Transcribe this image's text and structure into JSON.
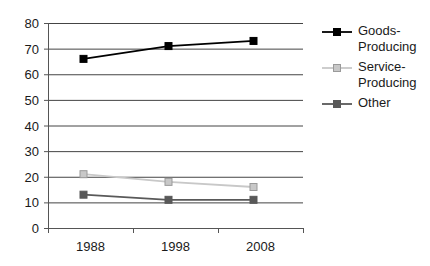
{
  "chart_data": {
    "type": "line",
    "title": "",
    "subtitle": "",
    "xlabel": "",
    "ylabel": "",
    "categories": [
      "1988",
      "1998",
      "2008"
    ],
    "ylim": [
      0,
      80
    ],
    "yticks": [
      0,
      10,
      20,
      30,
      40,
      50,
      60,
      70,
      80
    ],
    "ytick_labels": [
      "0",
      "10",
      "20",
      "30",
      "40",
      "50",
      "60",
      "70",
      "80"
    ],
    "grid": "horizontal",
    "legend_position": "right",
    "series": [
      {
        "name": "Goods-Producing",
        "legend_lines": [
          "Goods-",
          "Producing"
        ],
        "color": "#000000",
        "marker": "square",
        "values": [
          66,
          71,
          73
        ]
      },
      {
        "name": "Service-Producing",
        "legend_lines": [
          "Service-",
          "Producing"
        ],
        "color": "#c8c8c8",
        "marker": "square",
        "values": [
          21,
          18,
          16
        ]
      },
      {
        "name": "Other",
        "legend_lines": [
          "Other"
        ],
        "color": "#595959",
        "marker": "square",
        "values": [
          13,
          11,
          11
        ]
      }
    ],
    "axis_color": "#555555",
    "gridline_color": "#444444"
  }
}
